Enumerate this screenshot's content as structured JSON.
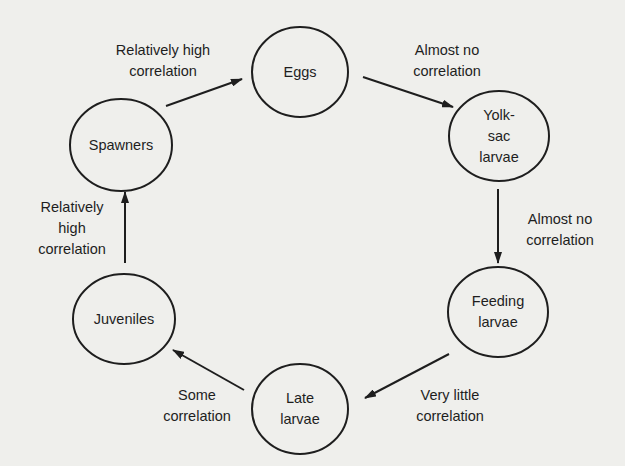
{
  "diagram": {
    "type": "life-cycle-correlation",
    "colors": {
      "background": "#efefec",
      "ink": "#1e1e1e"
    },
    "nodes": [
      {
        "id": "eggs",
        "label": "Eggs",
        "cx": 300,
        "cy": 72,
        "rx": 48,
        "ry": 45
      },
      {
        "id": "yolk-sac",
        "label": "Yolk-\nsac\nlarvae",
        "cx": 499,
        "cy": 136,
        "rx": 50,
        "ry": 45
      },
      {
        "id": "feeding",
        "label": "Feeding\nlarvae",
        "cx": 498,
        "cy": 312,
        "rx": 50,
        "ry": 45
      },
      {
        "id": "late",
        "label": "Late\nlarvae",
        "cx": 300,
        "cy": 409,
        "rx": 48,
        "ry": 45
      },
      {
        "id": "juveniles",
        "label": "Juveniles",
        "cx": 124,
        "cy": 319,
        "rx": 51,
        "ry": 45
      },
      {
        "id": "spawners",
        "label": "Spawners",
        "cx": 121,
        "cy": 145,
        "rx": 51,
        "ry": 46
      }
    ],
    "edges": [
      {
        "from": "spawners",
        "to": "eggs",
        "label": "Relatively high\ncorrelation",
        "x1": 166,
        "y1": 106,
        "x2": 242,
        "y2": 79,
        "lx": 163,
        "ly": 61
      },
      {
        "from": "eggs",
        "to": "yolk-sac",
        "label": "Almost no\ncorrelation",
        "x1": 363,
        "y1": 77,
        "x2": 453,
        "y2": 107,
        "lx": 447,
        "ly": 61
      },
      {
        "from": "yolk-sac",
        "to": "feeding",
        "label": "Almost no\ncorrelation",
        "x1": 498,
        "y1": 189,
        "x2": 498,
        "y2": 263,
        "lx": 560,
        "ly": 230
      },
      {
        "from": "feeding",
        "to": "late",
        "label": "Very little\ncorrelation",
        "x1": 449,
        "y1": 354,
        "x2": 365,
        "y2": 398,
        "lx": 450,
        "ly": 406
      },
      {
        "from": "late",
        "to": "juveniles",
        "label": "Some\ncorrelation",
        "x1": 244,
        "y1": 390,
        "x2": 173,
        "y2": 350,
        "lx": 197,
        "ly": 406
      },
      {
        "from": "juveniles",
        "to": "spawners",
        "label": "Relatively\nhigh\ncorrelation",
        "x1": 125,
        "y1": 263,
        "x2": 125,
        "y2": 192,
        "lx": 72,
        "ly": 228
      }
    ]
  }
}
